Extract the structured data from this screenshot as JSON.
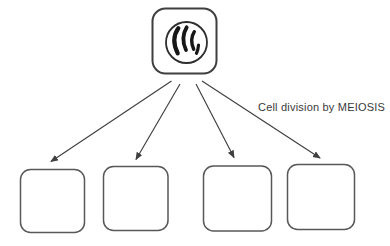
{
  "diagram": {
    "caption": "Cell division by MEIOSIS",
    "parent_cell": {
      "icon": "nucleus-with-chromosomes-icon",
      "chromosome_stroke_count": 4
    },
    "daughter_cells": {
      "count": 4
    },
    "arrows": {
      "count": 4
    },
    "colors": {
      "background": "#ffffff",
      "parent_outline": "#3f3f3f",
      "nucleus_outline": "#2e2e2e",
      "chromosome": "#161616",
      "daughter_outline": "#585858",
      "arrow": "#3f3f3f",
      "text": "#3a3a3a"
    }
  }
}
